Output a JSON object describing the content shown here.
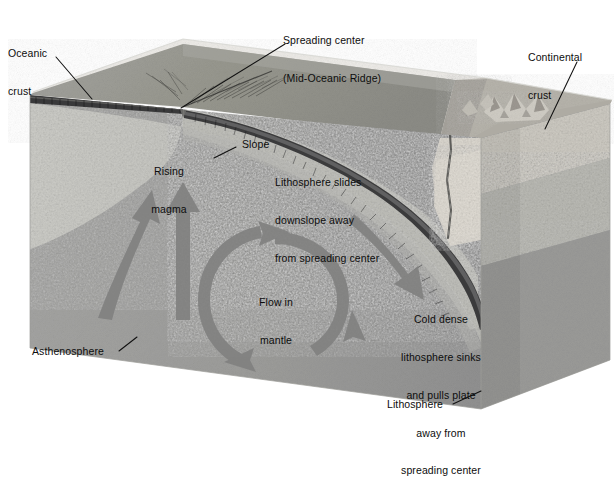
{
  "figure": {
    "type": "geological-block-diagram",
    "background_color": "#ffffff"
  },
  "palette": {
    "water": "#e9e9e6",
    "seafloor_top": "#9a9a97",
    "seafloor_top_far": "#8f8f8c",
    "oceanic_crust_band": "#3a3a38",
    "lithosphere": "#c9c9c4",
    "lithosphere_shadow": "#bdbdb8",
    "asthenosphere": "#9d9d9b",
    "asthenosphere_dark": "#8e8e8c",
    "continental_crust": "#dedbd4",
    "continental_top": "#b9b6ae",
    "continental_side": "#a9a6a0",
    "arrow": "#7c7c7a",
    "leader_line": "#111111",
    "text": "#0d0d0d"
  },
  "labels": {
    "oceanic_crust": {
      "line1": "Oceanic",
      "line2": "crust"
    },
    "spreading_center": {
      "line1": "Spreading center",
      "line2": "(Mid-Oceanic Ridge)"
    },
    "continental_crust": {
      "line1": "Continental",
      "line2": "crust"
    },
    "rising_magma": {
      "line1": "Rising",
      "line2": "magma"
    },
    "slope": {
      "text": "Slope"
    },
    "slides_downslope": {
      "line1": "Lithosphere slides",
      "line2": "downslope away",
      "line3": "from spreading center"
    },
    "flow_in_mantle": {
      "line1": "Flow in",
      "line2": "mantle"
    },
    "cold_dense": {
      "line1": "Cold dense",
      "line2": "lithosphere sinks",
      "line3": "and pulls plate",
      "line4": "away from",
      "line5": "spreading center"
    },
    "asthenosphere": {
      "text": "Asthenosphere"
    },
    "lithosphere": {
      "text": "Lithosphere"
    }
  },
  "annotations": [
    {
      "name": "oceanic-crust-leader",
      "from": [
        55,
        57
      ],
      "to": [
        90,
        97
      ]
    },
    {
      "name": "spreading-center-leader",
      "from": [
        285,
        44
      ],
      "to": [
        180,
        107
      ]
    },
    {
      "name": "continental-crust-leader",
      "from": [
        578,
        62
      ],
      "to": [
        545,
        128
      ]
    },
    {
      "name": "slope-leader",
      "from": [
        234,
        146
      ],
      "to": [
        215,
        157
      ]
    },
    {
      "name": "asthenosphere-leader",
      "from": [
        118,
        350
      ],
      "to": [
        135,
        337
      ]
    },
    {
      "name": "lithosphere-leader",
      "from": [
        452,
        403
      ],
      "to": [
        478,
        392
      ]
    }
  ],
  "flow_arrows": [
    {
      "name": "rising-magma-arrow-left",
      "direction": "up-right"
    },
    {
      "name": "rising-magma-arrow-right",
      "direction": "up"
    },
    {
      "name": "mantle-convection-cell",
      "direction": "clockwise",
      "arrowheads": 3
    },
    {
      "name": "slab-pull-arrow",
      "direction": "down-right"
    }
  ]
}
